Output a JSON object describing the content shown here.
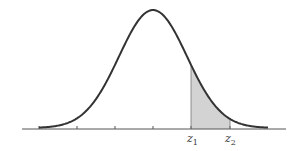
{
  "diagram": {
    "type": "normal-distribution-shaded-area",
    "curve": {
      "mean_x": 153,
      "sigma_px": 34,
      "peak_y": 10,
      "baseline_y": 128,
      "x_start": 39,
      "x_end": 268,
      "color": "#333333"
    },
    "axis": {
      "x_start": 22,
      "x_end": 286,
      "y": 129,
      "color": "#555555"
    },
    "ticks": [
      39,
      77,
      115,
      153,
      191,
      230
    ],
    "shaded_region": {
      "from_x": 191,
      "to_x": 230,
      "fill": "#d3d3d3",
      "from_label": "z1",
      "to_label": "z2"
    },
    "labels": [
      {
        "id": "z1",
        "base": "z",
        "sub": "1",
        "x": 187,
        "y": 142
      },
      {
        "id": "z2",
        "base": "z",
        "sub": "2",
        "x": 225,
        "y": 142
      }
    ]
  }
}
